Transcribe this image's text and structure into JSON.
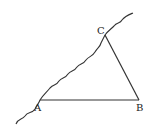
{
  "diagram": {
    "points": {
      "A": {
        "label": "A",
        "x": 40,
        "y": 100
      },
      "B": {
        "label": "B",
        "x": 139,
        "y": 100
      },
      "C": {
        "label": "C",
        "x": 105,
        "y": 35
      }
    },
    "segments": [
      "AB",
      "BC"
    ],
    "wavy_line": "riverbank line through A and C"
  }
}
